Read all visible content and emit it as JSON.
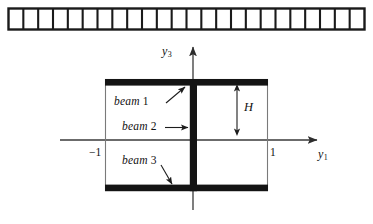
{
  "figure": {
    "title": "",
    "type": "engineering-diagram"
  },
  "strip": {
    "name": "element-strip",
    "cell_count": 24,
    "x": 8,
    "y": 8,
    "width": 357,
    "height": 22,
    "border_color": "#1a1a1a"
  },
  "axes": {
    "vertical": {
      "label": "y",
      "subscript": "3",
      "x": 193,
      "y_top": 46,
      "y_bottom": 210,
      "color": "#3a3a3a"
    },
    "horizontal": {
      "label": "y",
      "subscript": "1",
      "y": 140,
      "x_left": 60,
      "x_right": 318,
      "color": "#3a3a3a"
    },
    "ticks": [
      {
        "name": "tick-minus-one",
        "label": "−1",
        "x": 105
      },
      {
        "name": "tick-one",
        "label": "1",
        "x": 268
      }
    ]
  },
  "section": {
    "flange_color": "#111111",
    "outline_color": "#6e6e6e",
    "left": 105,
    "right": 268,
    "top": 79,
    "bottom": 191,
    "web_x": 193,
    "web_width": 7,
    "flange_thickness": 6
  },
  "labels": {
    "beam1": {
      "text": "beam",
      "number": "1",
      "x": 114,
      "y": 101
    },
    "beam2": {
      "text": "beam",
      "number": "2",
      "x": 122,
      "y": 126
    },
    "beam3": {
      "text": "beam",
      "number": "3",
      "x": 122,
      "y": 160
    },
    "height": {
      "text": "H",
      "x": 244,
      "y": 102
    }
  },
  "leaders": [
    {
      "name": "leader-beam-1",
      "from_x": 166,
      "from_y": 103,
      "to_x": 186,
      "to_y": 86
    },
    {
      "name": "leader-beam-2",
      "from_x": 165,
      "from_y": 128,
      "to_x": 190,
      "to_y": 128
    },
    {
      "name": "leader-beam-3",
      "from_x": 162,
      "from_y": 166,
      "to_x": 173,
      "to_y": 186
    }
  ],
  "dimension": {
    "name": "height-dimension",
    "x": 237,
    "y_top": 84,
    "y_bottom": 136
  }
}
